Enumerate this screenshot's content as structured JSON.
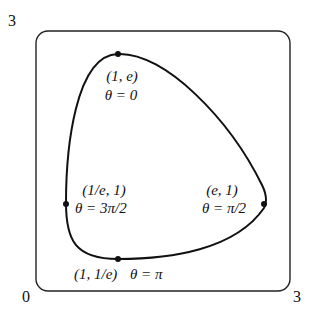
{
  "axis": {
    "origin_label": "0",
    "x_max_label": "3",
    "y_max_label": "3"
  },
  "points": [
    {
      "id": "top",
      "coord": "(1, e)",
      "theta": "θ = 0"
    },
    {
      "id": "right",
      "coord": "(e, 1)",
      "theta": "θ = π/2"
    },
    {
      "id": "bottom",
      "coord": "(1, 1/e)",
      "theta": "θ = π"
    },
    {
      "id": "left",
      "coord": "(1/e, 1)",
      "theta": "θ = 3π/2"
    }
  ],
  "colors": {
    "stroke": "#111111",
    "background": "#ffffff"
  }
}
